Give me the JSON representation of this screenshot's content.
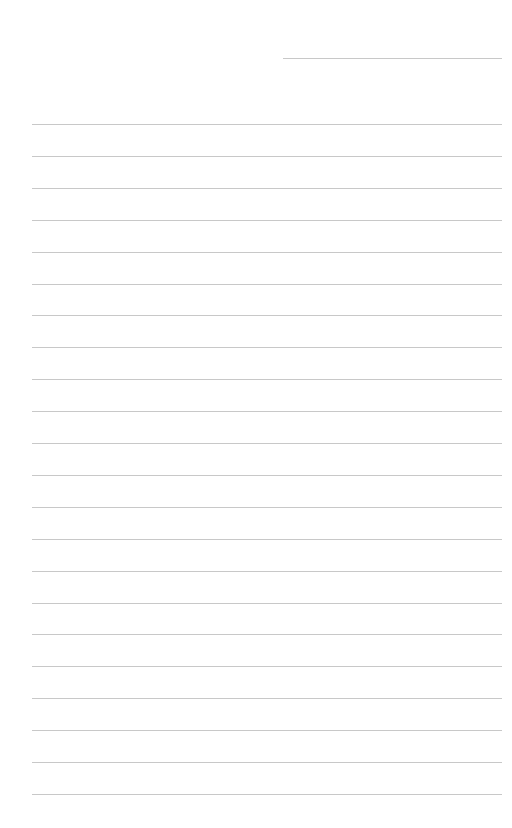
{
  "page": {
    "type": "lined-paper",
    "background": "#ffffff",
    "line_color": "#c8c8c8",
    "header_line": {
      "left": 283,
      "top": 58,
      "width": 219
    },
    "ruled_lines": {
      "count": 22,
      "left": 32,
      "width": 470,
      "first_top": 124,
      "spacing": 31.9
    }
  }
}
